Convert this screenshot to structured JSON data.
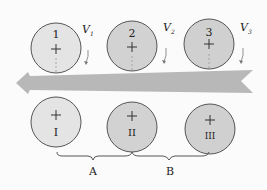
{
  "diagram": {
    "top_rolls": [
      {
        "label": "1",
        "cx": 56,
        "cy": 48,
        "fill": "#e4e4e4"
      },
      {
        "label": "2",
        "cx": 132,
        "cy": 46,
        "fill": "#d2d2d2"
      },
      {
        "label": "3",
        "cx": 209,
        "cy": 44,
        "fill": "#d0d0d0"
      }
    ],
    "bottom_rolls": [
      {
        "label": "I",
        "cx": 56,
        "cy": 122,
        "fill": "#e4e4e4"
      },
      {
        "label": "II",
        "cx": 132,
        "cy": 127,
        "fill": "#d2d2d2"
      },
      {
        "label": "III",
        "cx": 210,
        "cy": 129,
        "fill": "#d0d0d0"
      }
    ],
    "velocities": [
      {
        "label": "V",
        "sub": "1",
        "x": 82,
        "y": 33
      },
      {
        "label": "V",
        "sub": "2",
        "x": 163,
        "y": 31
      },
      {
        "label": "V",
        "sub": "3",
        "x": 240,
        "y": 31
      }
    ],
    "braces": [
      {
        "label": "A"
      },
      {
        "label": "B"
      }
    ],
    "band_color": "#b8b8b8",
    "roll_stroke": "#555555"
  }
}
